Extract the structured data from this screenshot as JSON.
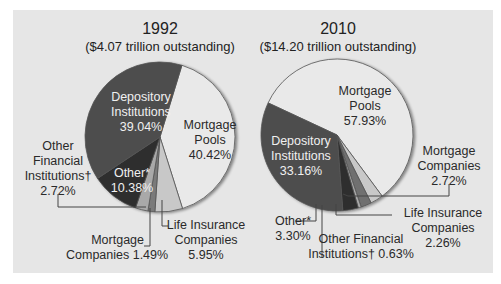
{
  "chart_data": [
    {
      "type": "pie",
      "title": "1992",
      "subtitle": "($4.07 trillion outstanding)",
      "slices": [
        {
          "label": "Mortgage Pools",
          "value": 40.42,
          "color": "#e9e9e9"
        },
        {
          "label": "Life Insurance Companies",
          "value": 5.95,
          "color": "#c8c8c8"
        },
        {
          "label": "Mortgage Companies",
          "value": 1.49,
          "color": "#7a7a7a"
        },
        {
          "label": "Other Financial Institutions†",
          "value": 2.72,
          "color": "#a9a9a9"
        },
        {
          "label": "Other*",
          "value": 10.38,
          "color": "#2e2e2e"
        },
        {
          "label": "Depository Institutions",
          "value": 39.04,
          "color": "#4d4d4d"
        }
      ],
      "start_angle_deg": 17
    },
    {
      "type": "pie",
      "title": "2010",
      "subtitle": "($14.20 trillion outstanding)",
      "slices": [
        {
          "label": "Mortgage Pools",
          "value": 57.93,
          "color": "#e9e9e9"
        },
        {
          "label": "Mortgage Companies",
          "value": 2.72,
          "color": "#c8c8c8"
        },
        {
          "label": "Life Insurance Companies",
          "value": 2.26,
          "color": "#6f6f6f"
        },
        {
          "label": "Other Financial Institutions†",
          "value": 0.63,
          "color": "#a9a9a9"
        },
        {
          "label": "Other*",
          "value": 3.3,
          "color": "#2e2e2e"
        },
        {
          "label": "Depository Institutions",
          "value": 33.16,
          "color": "#4d4d4d"
        }
      ],
      "start_angle_deg": -65
    }
  ],
  "left": {
    "title": "1992",
    "subtitle": "($4.07 trillion outstanding)",
    "labels": {
      "depository": [
        "Depository",
        "Institutions",
        "39.04%"
      ],
      "pools": [
        "Mortgage",
        "Pools",
        "40.42%"
      ],
      "other": [
        "Other*",
        "10.38%"
      ],
      "other_fin": [
        "Other",
        "Financial",
        "Institutions†",
        "2.72%"
      ],
      "mortgage_co": [
        "Mortgage",
        "Companies 1.49%"
      ],
      "life": [
        "Life Insurance",
        "Companies",
        "5.95%"
      ]
    }
  },
  "right": {
    "title": "2010",
    "subtitle": "($14.20 trillion outstanding)",
    "labels": {
      "pools": [
        "Mortgage",
        "Pools",
        "57.93%"
      ],
      "depository": [
        "Depository",
        "Institutions",
        "33.16%"
      ],
      "mortgage_co": [
        "Mortgage",
        "Companies",
        "2.72%"
      ],
      "life": [
        "Life Insurance",
        "Companies",
        "2.26%"
      ],
      "other": [
        "Other*",
        "3.30%"
      ],
      "other_fin": [
        "Other Financial",
        "Institutions† 0.63%"
      ]
    }
  }
}
